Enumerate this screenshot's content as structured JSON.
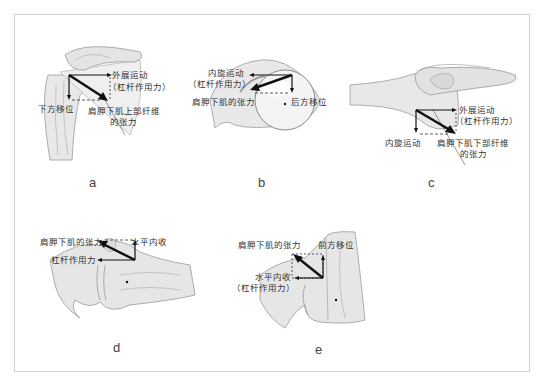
{
  "figure": {
    "panels": [
      {
        "id": "a",
        "caption": "a",
        "labels": {
          "abduction": "外展运动",
          "lever": "（杠杆作用力）",
          "downward": "下方移位",
          "tension_line1": "肩胛下肌上部纤维",
          "tension_line2": "的张力"
        }
      },
      {
        "id": "b",
        "caption": "b",
        "labels": {
          "internal_rotation": "内旋运动",
          "lever": "（杠杆作用力）",
          "tension": "肩胛下肌的张力",
          "posterior": "后方移位"
        }
      },
      {
        "id": "c",
        "caption": "c",
        "labels": {
          "abduction": "外展运动",
          "lever": "（杠杆作用力）",
          "internal_rotation": "内旋运动",
          "tension_line1": "肩胛下肌下部纤维",
          "tension_line2": "的张力"
        }
      },
      {
        "id": "d",
        "caption": "d",
        "labels": {
          "tension": "肩胛下肌的张力",
          "horizontal_adduction": "水平内收",
          "lever": "杠杆作用力"
        }
      },
      {
        "id": "e",
        "caption": "e",
        "labels": {
          "tension": "肩胛下肌的张力",
          "anterior": "前方移位",
          "horizontal_adduction": "水平内收",
          "lever": "（杠杆作用力）"
        }
      }
    ]
  },
  "colors": {
    "bone_fill": "#e6e6e6",
    "bone_stroke": "#9a9a9a",
    "arrow": "#111111",
    "frame": "#d2d2d2"
  }
}
